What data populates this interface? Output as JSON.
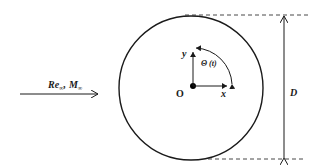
{
  "diagram": {
    "type": "cylinder-flow-schematic",
    "colors": {
      "stroke": "#1a1a1a",
      "background": "#ffffff"
    },
    "freestream": {
      "label_re": "Re",
      "label_re_sub": "∞",
      "separator": ",",
      "label_m": "M",
      "label_m_sub": "∞"
    },
    "origin": {
      "label": "O"
    },
    "axes": {
      "x_label": "x",
      "y_label": "y"
    },
    "rotation": {
      "label": "Θ (t)"
    },
    "diameter": {
      "label": "D"
    }
  }
}
